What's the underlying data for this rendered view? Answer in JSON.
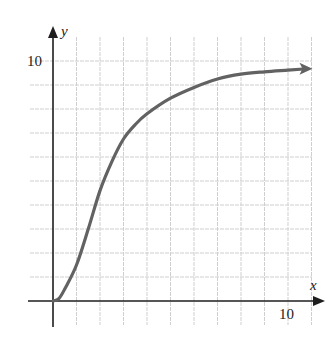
{
  "chart_data": {
    "type": "line",
    "title": "",
    "xlabel": "x",
    "ylabel": "y",
    "xlim": [
      -1,
      11
    ],
    "ylim": [
      -1,
      10.5
    ],
    "grid": true,
    "x_ticks_labeled": [
      10
    ],
    "y_ticks_labeled": [
      10
    ],
    "grid_step": 1,
    "series": [
      {
        "name": "curve",
        "arrow_at_end": true,
        "x": [
          0,
          0.25,
          0.5,
          1,
          1.5,
          2,
          2.5,
          3,
          3.5,
          4,
          5,
          6,
          7,
          8,
          9,
          10,
          11
        ],
        "values": [
          0,
          0.1,
          0.5,
          1.5,
          3.0,
          4.6,
          5.8,
          6.75,
          7.35,
          7.8,
          8.45,
          8.9,
          9.25,
          9.45,
          9.55,
          9.62,
          9.68
        ]
      }
    ],
    "colors": {
      "axis": "#1e1e1e",
      "curve": "#626262",
      "grid": "#cfcfcf"
    }
  },
  "labels": {
    "x_axis": "x",
    "y_axis": "y",
    "x_tick_10": "10",
    "y_tick_10": "10"
  }
}
